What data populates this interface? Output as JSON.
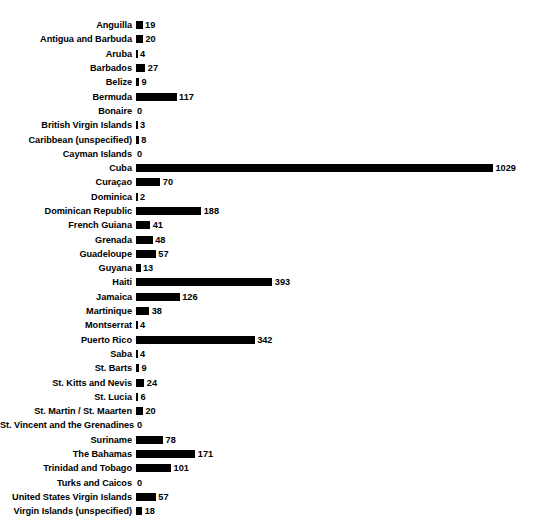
{
  "chart_data": {
    "type": "bar",
    "orientation": "horizontal",
    "title": "",
    "subtitle": "",
    "xlabel": "",
    "ylabel": "",
    "grid": false,
    "legend": null,
    "value_labels": true,
    "bar_color": "#000000",
    "background_color": "#ffffff",
    "xlim": [
      0,
      1029
    ],
    "categories": [
      "Anguilla",
      "Antigua and Barbuda",
      "Aruba",
      "Barbados",
      "Belize",
      "Bermuda",
      "Bonaire",
      "British Virgin Islands",
      "Caribbean (unspecified)",
      "Cayman Islands",
      "Cuba",
      "Curaçao",
      "Dominica",
      "Dominican Republic",
      "French Guiana",
      "Grenada",
      "Guadeloupe",
      "Guyana",
      "Haiti",
      "Jamaica",
      "Martinique",
      "Montserrat",
      "Puerto Rico",
      "Saba",
      "St. Barts",
      "St. Kitts and Nevis",
      "St. Lucia",
      "St. Martin / St. Maarten",
      "St. Vincent and the Grenadines",
      "Suriname",
      "The Bahamas",
      "Trinidad and Tobago",
      "Turks and Caicos",
      "United States Virgin Islands",
      "Virgin Islands (unspecified)"
    ],
    "values": [
      19,
      20,
      4,
      27,
      9,
      117,
      0,
      3,
      8,
      0,
      1029,
      70,
      2,
      188,
      41,
      48,
      57,
      13,
      393,
      126,
      38,
      4,
      342,
      4,
      9,
      24,
      6,
      20,
      0,
      78,
      171,
      101,
      0,
      57,
      18
    ],
    "rows": [
      {
        "label": "Anguilla",
        "value": 19,
        "value_text": "19"
      },
      {
        "label": "Antigua and Barbuda",
        "value": 20,
        "value_text": "20"
      },
      {
        "label": "Aruba",
        "value": 4,
        "value_text": "4"
      },
      {
        "label": "Barbados",
        "value": 27,
        "value_text": "27"
      },
      {
        "label": "Belize",
        "value": 9,
        "value_text": "9"
      },
      {
        "label": "Bermuda",
        "value": 117,
        "value_text": "117"
      },
      {
        "label": "Bonaire",
        "value": 0,
        "value_text": "0"
      },
      {
        "label": "British Virgin Islands",
        "value": 3,
        "value_text": "3"
      },
      {
        "label": "Caribbean (unspecified)",
        "value": 8,
        "value_text": "8"
      },
      {
        "label": "Cayman Islands",
        "value": 0,
        "value_text": "0"
      },
      {
        "label": "Cuba",
        "value": 1029,
        "value_text": "1029"
      },
      {
        "label": "Curaçao",
        "value": 70,
        "value_text": "70"
      },
      {
        "label": "Dominica",
        "value": 2,
        "value_text": "2"
      },
      {
        "label": "Dominican Republic",
        "value": 188,
        "value_text": "188"
      },
      {
        "label": "French Guiana",
        "value": 41,
        "value_text": "41"
      },
      {
        "label": "Grenada",
        "value": 48,
        "value_text": "48"
      },
      {
        "label": "Guadeloupe",
        "value": 57,
        "value_text": "57"
      },
      {
        "label": "Guyana",
        "value": 13,
        "value_text": "13"
      },
      {
        "label": "Haiti",
        "value": 393,
        "value_text": "393"
      },
      {
        "label": "Jamaica",
        "value": 126,
        "value_text": "126"
      },
      {
        "label": "Martinique",
        "value": 38,
        "value_text": "38"
      },
      {
        "label": "Montserrat",
        "value": 4,
        "value_text": "4"
      },
      {
        "label": "Puerto Rico",
        "value": 342,
        "value_text": "342"
      },
      {
        "label": "Saba",
        "value": 4,
        "value_text": "4"
      },
      {
        "label": "St. Barts",
        "value": 9,
        "value_text": "9"
      },
      {
        "label": "St. Kitts and Nevis",
        "value": 24,
        "value_text": "24"
      },
      {
        "label": "St. Lucia",
        "value": 6,
        "value_text": "6"
      },
      {
        "label": "St. Martin / St. Maarten",
        "value": 20,
        "value_text": "20"
      },
      {
        "label": "St. Vincent and the Grenadines",
        "value": 0,
        "value_text": "0"
      },
      {
        "label": "Suriname",
        "value": 78,
        "value_text": "78"
      },
      {
        "label": "The Bahamas",
        "value": 171,
        "value_text": "171"
      },
      {
        "label": "Trinidad and Tobago",
        "value": 101,
        "value_text": "101"
      },
      {
        "label": "Turks and Caicos",
        "value": 0,
        "value_text": "0"
      },
      {
        "label": "United States Virgin Islands",
        "value": 57,
        "value_text": "57"
      },
      {
        "label": "Virgin Islands (unspecified)",
        "value": 18,
        "value_text": "18"
      }
    ]
  }
}
